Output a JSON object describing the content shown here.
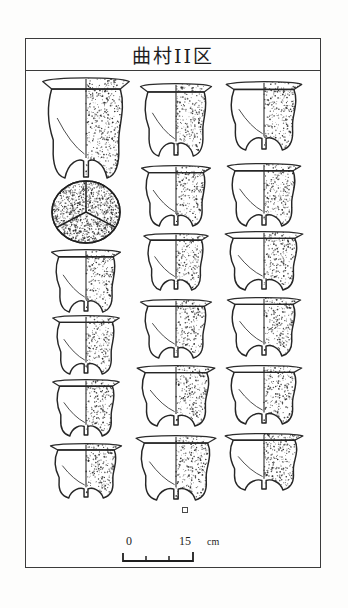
{
  "plate": {
    "title": "曲村II区",
    "border_color": "#3b3b3b",
    "background_color": "#fefefe"
  },
  "scale": {
    "zero_label": "0",
    "max_label": "15",
    "unit_label": "cm",
    "ticks": 4,
    "length_cm": 15
  },
  "figure_caption": "",
  "chart_data": {
    "type": "table",
    "title": "曲村II区",
    "xlabel": "",
    "ylabel": "",
    "columns": [
      "column-1",
      "column-2",
      "column-3"
    ],
    "rows": 6,
    "note": "Archaeological pottery plate: half-section line drawings of li tripod vessels, stippled on right half.",
    "specimens": [
      {
        "id": "c1r1",
        "column": 1,
        "row": 1,
        "view": "profile-half-section",
        "form": "li-tripod-tall",
        "width_px": 78,
        "height_px": 100,
        "stipple_side": "right",
        "legs": 3
      },
      {
        "id": "c1r2",
        "column": 1,
        "row": 2,
        "view": "plan-bottom",
        "form": "li-tripod-base-lobes",
        "width_px": 68,
        "height_px": 62,
        "stipple_side": "full",
        "legs": 3
      },
      {
        "id": "c1r3",
        "column": 1,
        "row": 3,
        "view": "profile-half-section",
        "form": "li-tripod-short",
        "width_px": 62,
        "height_px": 62,
        "stipple_side": "right",
        "legs": 3
      },
      {
        "id": "c1r4",
        "column": 1,
        "row": 4,
        "view": "profile-half-section",
        "form": "li-tripod-short",
        "width_px": 60,
        "height_px": 58,
        "stipple_side": "right",
        "legs": 3
      },
      {
        "id": "c1r5",
        "column": 1,
        "row": 5,
        "view": "profile-half-section",
        "form": "li-tripod-short",
        "width_px": 60,
        "height_px": 56,
        "stipple_side": "right",
        "legs": 3
      },
      {
        "id": "c1r6",
        "column": 1,
        "row": 6,
        "view": "profile-half-section",
        "form": "li-tripod-wide-rim",
        "width_px": 64,
        "height_px": 54,
        "stipple_side": "right",
        "legs": 3
      },
      {
        "id": "c2r1",
        "column": 2,
        "row": 1,
        "view": "profile-half-section",
        "form": "li-tripod-tall",
        "width_px": 64,
        "height_px": 72,
        "stipple_side": "right",
        "legs": 3
      },
      {
        "id": "c2r2",
        "column": 2,
        "row": 2,
        "view": "profile-half-section",
        "form": "li-tripod-medium",
        "width_px": 62,
        "height_px": 60,
        "stipple_side": "right",
        "legs": 3
      },
      {
        "id": "c2r3",
        "column": 2,
        "row": 3,
        "view": "profile-half-section",
        "form": "li-tripod-medium",
        "width_px": 58,
        "height_px": 56,
        "stipple_side": "right",
        "legs": 3
      },
      {
        "id": "c2r4",
        "column": 2,
        "row": 4,
        "view": "profile-half-section",
        "form": "li-tripod-medium",
        "width_px": 64,
        "height_px": 58,
        "stipple_side": "right",
        "legs": 3
      },
      {
        "id": "c2r5",
        "column": 2,
        "row": 5,
        "view": "profile-half-section",
        "form": "li-tripod-large",
        "width_px": 70,
        "height_px": 60,
        "stipple_side": "right",
        "legs": 3
      },
      {
        "id": "c2r6",
        "column": 2,
        "row": 6,
        "view": "profile-half-section",
        "form": "li-tripod-large-legs",
        "width_px": 72,
        "height_px": 64,
        "stipple_side": "right",
        "legs": 3,
        "has_datum_mark": true
      },
      {
        "id": "c3r1",
        "column": 3,
        "row": 1,
        "view": "profile-half-section",
        "form": "li-tripod-tall",
        "width_px": 68,
        "height_px": 68,
        "stipple_side": "right",
        "legs": 3
      },
      {
        "id": "c3r2",
        "column": 3,
        "row": 2,
        "view": "profile-half-section",
        "form": "li-tripod-medium",
        "width_px": 66,
        "height_px": 62,
        "stipple_side": "right",
        "legs": 3
      },
      {
        "id": "c3r3",
        "column": 3,
        "row": 3,
        "view": "profile-half-section",
        "form": "li-tripod-medium",
        "width_px": 70,
        "height_px": 58,
        "stipple_side": "right",
        "legs": 3
      },
      {
        "id": "c3r4",
        "column": 3,
        "row": 4,
        "view": "profile-half-section",
        "form": "li-tripod-medium",
        "width_px": 66,
        "height_px": 58,
        "stipple_side": "right",
        "legs": 3
      },
      {
        "id": "c3r5",
        "column": 3,
        "row": 5,
        "view": "profile-half-section",
        "form": "li-tripod-medium",
        "width_px": 68,
        "height_px": 58,
        "stipple_side": "right",
        "legs": 3
      },
      {
        "id": "c3r6",
        "column": 3,
        "row": 6,
        "view": "profile-half-section",
        "form": "li-tripod-wide-rim",
        "width_px": 70,
        "height_px": 56,
        "stipple_side": "right",
        "legs": 3
      }
    ]
  }
}
